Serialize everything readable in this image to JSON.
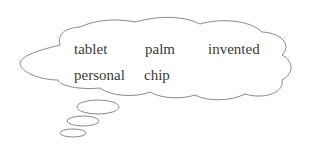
{
  "diagram": {
    "type": "thought-bubble",
    "words": [
      {
        "text": "tablet",
        "x": 74,
        "y": 42
      },
      {
        "text": "palm",
        "x": 145,
        "y": 42
      },
      {
        "text": "invented",
        "x": 208,
        "y": 42
      },
      {
        "text": "personal",
        "x": 74,
        "y": 68
      },
      {
        "text": "chip",
        "x": 144,
        "y": 68
      }
    ],
    "colors": {
      "outline": "#8a8a8a",
      "text": "#3a3a3a",
      "background": "#ffffff"
    }
  }
}
